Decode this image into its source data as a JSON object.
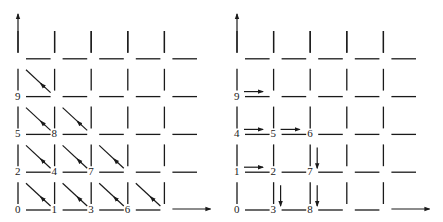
{
  "figure": {
    "type": "lattice-path diagram",
    "panels": [
      {
        "name": "left-panel",
        "description": "5x5 grid of cells with diagonal arrows pointing down-right; cells numbered in anti-diagonal order",
        "origin_x": 0,
        "grid_cols": 5,
        "grid_rows": 5,
        "cell_labels": [
          {
            "col": 0,
            "row": 0,
            "label": "0"
          },
          {
            "col": 1,
            "row": 0,
            "label": "1"
          },
          {
            "col": 2,
            "row": 0,
            "label": "3"
          },
          {
            "col": 3,
            "row": 0,
            "label": "6"
          },
          {
            "col": 0,
            "row": 1,
            "label": "2"
          },
          {
            "col": 1,
            "row": 1,
            "label": "4"
          },
          {
            "col": 2,
            "row": 1,
            "label": "7"
          },
          {
            "col": 0,
            "row": 2,
            "label": "5"
          },
          {
            "col": 1,
            "row": 2,
            "label": "8"
          },
          {
            "col": 0,
            "row": 3,
            "label": "9"
          }
        ],
        "arrows": [
          {
            "col": 0,
            "row": 0,
            "dir": "diag"
          },
          {
            "col": 1,
            "row": 0,
            "dir": "diag"
          },
          {
            "col": 2,
            "row": 0,
            "dir": "diag"
          },
          {
            "col": 3,
            "row": 0,
            "dir": "diag"
          },
          {
            "col": 0,
            "row": 1,
            "dir": "diag"
          },
          {
            "col": 1,
            "row": 1,
            "dir": "diag"
          },
          {
            "col": 2,
            "row": 1,
            "dir": "diag"
          },
          {
            "col": 0,
            "row": 2,
            "dir": "diag"
          },
          {
            "col": 1,
            "row": 2,
            "dir": "diag"
          },
          {
            "col": 0,
            "row": 3,
            "dir": "diag"
          }
        ]
      },
      {
        "name": "right-panel",
        "description": "5x5 grid of cells with right and down arrows; cells numbered in square-shell order",
        "origin_x": 219,
        "grid_cols": 5,
        "grid_rows": 5,
        "cell_labels": [
          {
            "col": 0,
            "row": 0,
            "label": "0"
          },
          {
            "col": 1,
            "row": 0,
            "label": "3"
          },
          {
            "col": 2,
            "row": 0,
            "label": "8"
          },
          {
            "col": 0,
            "row": 1,
            "label": "1"
          },
          {
            "col": 1,
            "row": 1,
            "label": "2"
          },
          {
            "col": 2,
            "row": 1,
            "label": "7"
          },
          {
            "col": 0,
            "row": 2,
            "label": "4"
          },
          {
            "col": 1,
            "row": 2,
            "label": "5"
          },
          {
            "col": 2,
            "row": 2,
            "label": "6"
          },
          {
            "col": 0,
            "row": 3,
            "label": "9"
          }
        ],
        "arrows": [
          {
            "col": 1,
            "row": 0,
            "dir": "down"
          },
          {
            "col": 2,
            "row": 0,
            "dir": "down"
          },
          {
            "col": 0,
            "row": 1,
            "dir": "right"
          },
          {
            "col": 2,
            "row": 1,
            "dir": "down"
          },
          {
            "col": 0,
            "row": 2,
            "dir": "right"
          },
          {
            "col": 1,
            "row": 2,
            "dir": "right"
          },
          {
            "col": 0,
            "row": 3,
            "dir": "right"
          }
        ]
      }
    ],
    "axes": {
      "x_axis_arrow": "right",
      "y_axis_arrow": "up"
    }
  }
}
